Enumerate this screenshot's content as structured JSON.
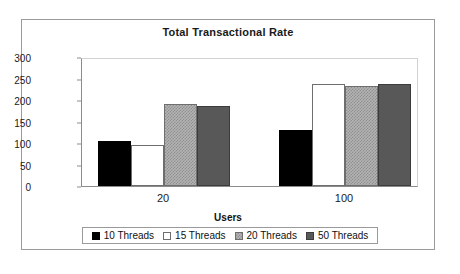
{
  "chart_data": {
    "type": "bar",
    "title": "Total Transactional Rate",
    "xlabel": "Users",
    "ylabel": "Transactions per Second",
    "categories": [
      "20",
      "100"
    ],
    "ylim": [
      0,
      300
    ],
    "yticks": [
      0,
      50,
      100,
      150,
      200,
      250,
      300
    ],
    "grid": false,
    "legend_position": "bottom",
    "series": [
      {
        "name": "10 Threads",
        "color": "#000000",
        "values": [
          105,
          130
        ]
      },
      {
        "name": "15 Threads",
        "color": "#ffffff",
        "values": [
          95,
          237
        ]
      },
      {
        "name": "20 Threads",
        "color": "#b4b4b4",
        "values": [
          190,
          233
        ]
      },
      {
        "name": "50 Threads",
        "color": "#585858",
        "values": [
          187,
          238
        ]
      }
    ]
  },
  "axis": {
    "y_tick_labels": [
      "300",
      "250",
      "200",
      "150",
      "100",
      "50",
      "0"
    ],
    "x_tick_labels": [
      "20",
      "100"
    ]
  },
  "legend": {
    "items": [
      {
        "label": "10 Threads"
      },
      {
        "label": "15 Threads"
      },
      {
        "label": "20 Threads"
      },
      {
        "label": "50 Threads"
      }
    ]
  }
}
